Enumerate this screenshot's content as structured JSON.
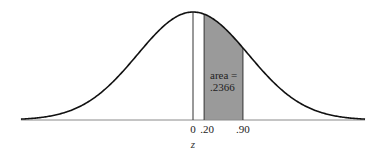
{
  "chart_data": {
    "type": "area",
    "title": "",
    "xlabel": "z",
    "ylabel": "",
    "xlim": [
      -3.1,
      3.1
    ],
    "grid": false,
    "legend": null,
    "curve": {
      "distribution": "standard normal",
      "mean": 0,
      "sd": 1
    },
    "shaded_region": {
      "from": 0.2,
      "to": 0.9,
      "area": 0.2366
    },
    "reference_line": {
      "z": 0
    },
    "tick_labels": [
      {
        "value": 0,
        "label": "0"
      },
      {
        "value": 0.2,
        "label": ".20"
      },
      {
        "value": 0.9,
        "label": ".90"
      }
    ],
    "annotation": {
      "line1": "area =",
      "line2": ".2366"
    }
  },
  "colors": {
    "curve": "#111111",
    "shade": "#9a9a9a",
    "axis": "#8a8a8a",
    "edge": "#333333"
  }
}
